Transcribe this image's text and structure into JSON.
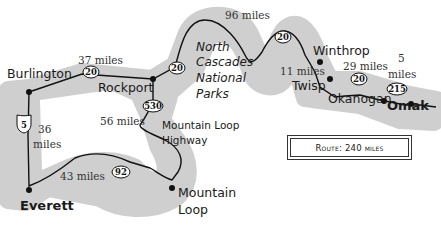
{
  "map": {
    "colors": {
      "corridor": "#cfcfcf",
      "route": "#111111",
      "background": "#ffffff"
    },
    "legend": {
      "label": "Route: 240 miles"
    },
    "region_label": {
      "line1": "North",
      "line2": "Cascades",
      "line3": "National",
      "line4": "Parks"
    },
    "road_label": {
      "line1": "Mountain Loop",
      "line2": "Highway"
    },
    "cities": [
      {
        "name": "Burlington"
      },
      {
        "name": "Rockport"
      },
      {
        "name": "Winthrop"
      },
      {
        "name": "Twisp"
      },
      {
        "name": "Okanogan"
      },
      {
        "name": "Omak"
      },
      {
        "name": "Everett"
      },
      {
        "name_line1": "Mountain",
        "name_line2": "Loop"
      }
    ],
    "segments": [
      {
        "distance": "37 miles"
      },
      {
        "distance": "96 miles"
      },
      {
        "distance": "11 miles"
      },
      {
        "distance": "29 miles"
      },
      {
        "distance_line1": "5",
        "distance_line2": "miles"
      },
      {
        "distance_line1": "36",
        "distance_line2": "miles"
      },
      {
        "distance": "56 miles"
      },
      {
        "distance": "43 miles"
      }
    ],
    "shields": [
      {
        "number": "20",
        "type": "state-route"
      },
      {
        "number": "20",
        "type": "state-route"
      },
      {
        "number": "20",
        "type": "state-route"
      },
      {
        "number": "20",
        "type": "state-route"
      },
      {
        "number": "215",
        "type": "state-route"
      },
      {
        "number": "5",
        "type": "interstate"
      },
      {
        "number": "530",
        "type": "state-route"
      },
      {
        "number": "92",
        "type": "state-route"
      }
    ]
  }
}
